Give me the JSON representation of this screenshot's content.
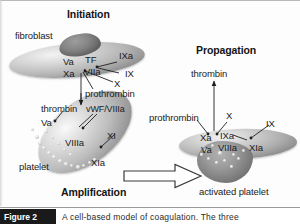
{
  "figure": {
    "sections": {
      "initiation": "Initiation",
      "amplification": "Amplification",
      "propagation": "Propagation"
    },
    "cells": {
      "fibroblast": "fibroblast",
      "platelet": "platelet",
      "activated_platelet": "activated platelet"
    },
    "initiation_labels": {
      "va": "Va",
      "xa": "Xa",
      "tf": "TF",
      "viia": "VIIa",
      "ixa": "IXa",
      "ix": "IX",
      "x": "X",
      "prothrombin": "prothrombin"
    },
    "amplification_labels": {
      "thrombin": "thrombin",
      "vwf_viiia": "vWF/VIIIa",
      "va": "Va",
      "viiia": "VIIIa",
      "xi": "XI",
      "xia": "XIa"
    },
    "propagation_labels": {
      "thrombin": "thrombin",
      "prothrombin": "prothrombin",
      "x": "X",
      "xa": "Xa",
      "ixa": "IXa",
      "viiia": "VIIIa",
      "ix": "IX",
      "xia": "XIa",
      "va": "Va"
    },
    "icons": {
      "flow_arrow": "block-arrow-right-icon",
      "thrombin_arrow": "arrow-up-icon"
    },
    "colors": {
      "background": "#ffffff",
      "text": "#1b1b1b",
      "connector": "#1f1f1f",
      "cell_fill": "#b6b6b6",
      "caption_tag_bg": "#1a1a1a"
    }
  },
  "caption": {
    "tag": "Figure 2",
    "text": "A cell-based model of coagulation. The three"
  }
}
